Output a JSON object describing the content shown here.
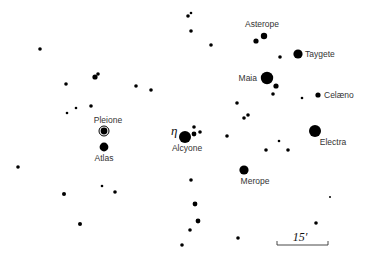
{
  "colors": {
    "star": "#000000",
    "label": "#333333",
    "background": "#ffffff"
  },
  "named_stars": [
    {
      "name": "Asterope",
      "x": 264,
      "y": 36,
      "r": 3.2,
      "label_x": 262,
      "label_y": 27,
      "anchor": "middle"
    },
    {
      "name": "Taygete",
      "x": 298,
      "y": 54,
      "r": 4.6,
      "label_x": 305,
      "label_y": 57,
      "anchor": "start"
    },
    {
      "name": "Maia",
      "x": 267,
      "y": 78,
      "r": 6.2,
      "label_x": 257,
      "label_y": 81,
      "anchor": "end"
    },
    {
      "name": "Celæno",
      "x": 318,
      "y": 95,
      "r": 2.6,
      "label_x": 324,
      "label_y": 98,
      "anchor": "start"
    },
    {
      "name": "Pleione",
      "x": 104,
      "y": 131,
      "r": 3.4,
      "ring": true,
      "label_x": 108,
      "label_y": 123,
      "anchor": "middle"
    },
    {
      "name": "Alcyone",
      "x": 185,
      "y": 137,
      "r": 6.0,
      "label_x": 187,
      "label_y": 151,
      "anchor": "middle"
    },
    {
      "name": "Electra",
      "x": 315,
      "y": 131,
      "r": 6.0,
      "label_x": 333,
      "label_y": 145,
      "anchor": "middle"
    },
    {
      "name": "Atlas",
      "x": 104,
      "y": 147,
      "r": 4.4,
      "label_x": 104,
      "label_y": 161,
      "anchor": "middle"
    },
    {
      "name": "Merope",
      "x": 244,
      "y": 170,
      "r": 4.6,
      "label_x": 255,
      "label_y": 184,
      "anchor": "middle"
    }
  ],
  "eta_label": {
    "text": "η",
    "x": 171,
    "y": 135
  },
  "stars": [
    {
      "x": 188,
      "y": 16,
      "r": 1.8
    },
    {
      "x": 191,
      "y": 13,
      "r": 1.3
    },
    {
      "x": 191,
      "y": 31,
      "r": 1.8
    },
    {
      "x": 211,
      "y": 45,
      "r": 1.8
    },
    {
      "x": 256,
      "y": 41,
      "r": 2.6
    },
    {
      "x": 280,
      "y": 57,
      "r": 1.8
    },
    {
      "x": 276,
      "y": 86,
      "r": 2.6
    },
    {
      "x": 273,
      "y": 94,
      "r": 1.8
    },
    {
      "x": 302,
      "y": 98,
      "r": 1.3
    },
    {
      "x": 237,
      "y": 103,
      "r": 1.8
    },
    {
      "x": 248,
      "y": 115,
      "r": 1.8
    },
    {
      "x": 244,
      "y": 118,
      "r": 1.8
    },
    {
      "x": 227,
      "y": 136,
      "r": 1.8
    },
    {
      "x": 279,
      "y": 141,
      "r": 1.3
    },
    {
      "x": 266,
      "y": 150,
      "r": 1.8
    },
    {
      "x": 288,
      "y": 150,
      "r": 1.8
    },
    {
      "x": 194,
      "y": 127,
      "r": 1.8
    },
    {
      "x": 194,
      "y": 134,
      "r": 2.4
    },
    {
      "x": 200,
      "y": 132,
      "r": 1.8
    },
    {
      "x": 40,
      "y": 49,
      "r": 1.8
    },
    {
      "x": 95,
      "y": 77,
      "r": 2.6
    },
    {
      "x": 98,
      "y": 74,
      "r": 1.8
    },
    {
      "x": 66,
      "y": 84,
      "r": 1.8
    },
    {
      "x": 136,
      "y": 86,
      "r": 1.8
    },
    {
      "x": 151,
      "y": 90,
      "r": 1.8
    },
    {
      "x": 91,
      "y": 106,
      "r": 1.8
    },
    {
      "x": 76,
      "y": 108,
      "r": 1.3
    },
    {
      "x": 67,
      "y": 113,
      "r": 1.3
    },
    {
      "x": 18,
      "y": 167,
      "r": 1.8
    },
    {
      "x": 64,
      "y": 194,
      "r": 2.0
    },
    {
      "x": 102,
      "y": 186,
      "r": 1.3
    },
    {
      "x": 115,
      "y": 192,
      "r": 1.8
    },
    {
      "x": 80,
      "y": 224,
      "r": 2.0
    },
    {
      "x": 191,
      "y": 180,
      "r": 1.8
    },
    {
      "x": 195,
      "y": 204,
      "r": 2.4
    },
    {
      "x": 198,
      "y": 221,
      "r": 2.4
    },
    {
      "x": 190,
      "y": 230,
      "r": 1.8
    },
    {
      "x": 182,
      "y": 245,
      "r": 1.8
    },
    {
      "x": 238,
      "y": 238,
      "r": 1.8
    },
    {
      "x": 330,
      "y": 197,
      "r": 1.0
    },
    {
      "x": 316,
      "y": 223,
      "r": 1.8
    }
  ],
  "scale_bar": {
    "label": "15′",
    "x1": 277,
    "x2": 328,
    "y": 245,
    "tick": 4,
    "label_x": 300,
    "label_y": 241
  }
}
